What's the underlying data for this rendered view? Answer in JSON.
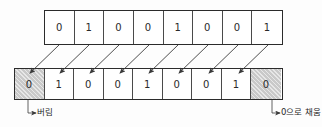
{
  "diagram": {
    "colors": {
      "border": "#2b2b2b",
      "cell_divider": "#4a4a4a",
      "shaded_fill": "#c9c9c9",
      "text": "#2a2a2a",
      "background": "#fdfdfd",
      "arrow": "#3a3a3a"
    },
    "top_row": {
      "name": "original-bits",
      "bits": [
        "0",
        "1",
        "0",
        "0",
        "1",
        "0",
        "0",
        "1"
      ]
    },
    "bottom_row": {
      "name": "shifted-bits",
      "bits": [
        {
          "value": "0",
          "shaded": true
        },
        {
          "value": "1",
          "shaded": false
        },
        {
          "value": "0",
          "shaded": false
        },
        {
          "value": "0",
          "shaded": false
        },
        {
          "value": "1",
          "shaded": false
        },
        {
          "value": "0",
          "shaded": false
        },
        {
          "value": "0",
          "shaded": false
        },
        {
          "value": "1",
          "shaded": false
        },
        {
          "value": "0",
          "shaded": true
        }
      ]
    },
    "annotations": {
      "discard_label": "버림",
      "fill_label": "0으로 채움"
    },
    "arrows": [
      {
        "from_x": 59,
        "from_y": 45,
        "to_x": 30,
        "to_y": 73
      },
      {
        "from_x": 89,
        "from_y": 45,
        "to_x": 60,
        "to_y": 73
      },
      {
        "from_x": 119,
        "from_y": 45,
        "to_x": 90,
        "to_y": 73
      },
      {
        "from_x": 149,
        "from_y": 45,
        "to_x": 120,
        "to_y": 73
      },
      {
        "from_x": 178,
        "from_y": 45,
        "to_x": 149,
        "to_y": 73
      },
      {
        "from_x": 208,
        "from_y": 45,
        "to_x": 179,
        "to_y": 73
      },
      {
        "from_x": 238,
        "from_y": 45,
        "to_x": 209,
        "to_y": 73
      },
      {
        "from_x": 268,
        "from_y": 45,
        "to_x": 239,
        "to_y": 73
      }
    ],
    "leaders": [
      {
        "name": "discard-leader",
        "x": 28,
        "y_top": 100,
        "y_bottom": 113,
        "x_end": 36
      },
      {
        "name": "fill-leader",
        "x": 272,
        "y_top": 100,
        "y_bottom": 113,
        "x_end": 280
      }
    ]
  }
}
